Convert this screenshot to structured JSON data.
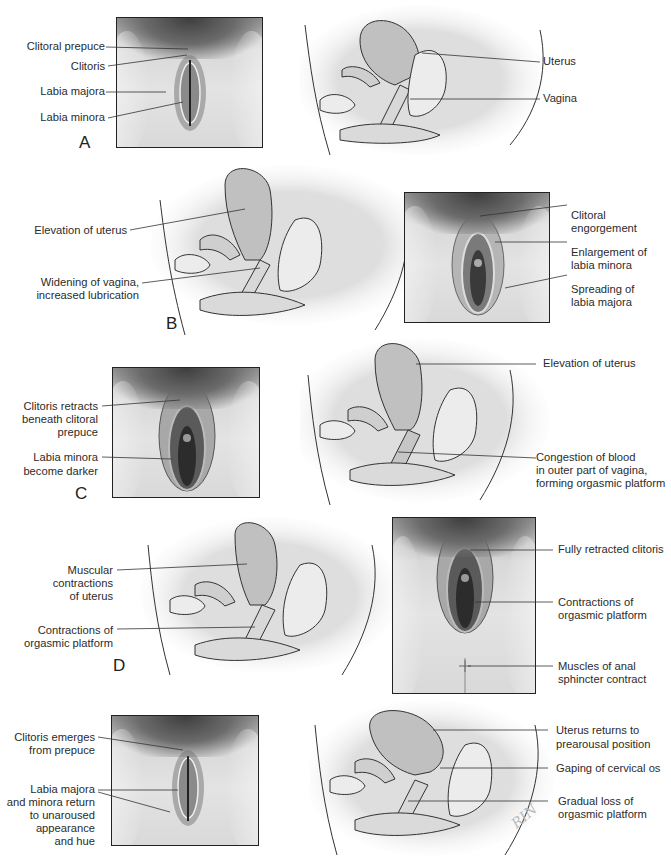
{
  "figure": {
    "panels": [
      {
        "letter": "A",
        "external_labels": [
          "Clitoral prepuce",
          "Clitoris",
          "Labia majora",
          "Labia minora"
        ],
        "internal_labels": [
          "Uterus",
          "Vagina"
        ]
      },
      {
        "letter": "B",
        "internal_labels": [
          "Elevation of uterus",
          "Widening of vagina,",
          "increased lubrication"
        ],
        "external_labels": [
          "Clitoral",
          "engorgement",
          "Enlargement of",
          "labia minora",
          "Spreading of",
          "labia majora"
        ]
      },
      {
        "letter": "C",
        "external_labels": [
          "Clitoris retracts",
          "beneath clitoral",
          "prepuce",
          "Labia minora",
          "become darker"
        ],
        "internal_labels": [
          "Elevation of uterus",
          "Congestion of blood",
          "in outer part of vagina,",
          "forming orgasmic platform"
        ]
      },
      {
        "letter": "D",
        "internal_labels": [
          "Muscular",
          "contractions",
          "of uterus",
          "Contractions of",
          "orgasmic platform"
        ],
        "external_labels": [
          "Fully retracted clitoris",
          "Contractions of",
          "orgasmic platform",
          "Muscles of anal",
          "sphincter contract"
        ]
      },
      {
        "letter": "E",
        "external_labels": [
          "Clitoris emerges",
          "from prepuce",
          "Labia majora",
          "and minora return",
          "to unaroused",
          "appearance",
          "and hue"
        ],
        "internal_labels": [
          "Uterus returns to",
          "prearousal position",
          "Gaping of cervical os",
          "Gradual loss of",
          "orgasmic platform"
        ]
      }
    ],
    "signature": "RIN"
  },
  "colors": {
    "line": "#2a2a2a",
    "uterus_fill": "#bdbdbd",
    "tissue_fill": "#e6e6e6",
    "halo": "#dcdcdc"
  }
}
